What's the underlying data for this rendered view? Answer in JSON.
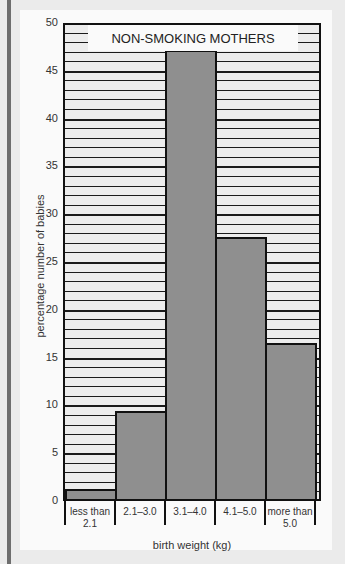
{
  "chart_data": {
    "type": "bar",
    "title": "NON-SMOKING MOTHERS",
    "categories": [
      "less than 2.1",
      "2.1–3.0",
      "3.1–4.0",
      "4.1–5.0",
      "more than 5.0"
    ],
    "category_lines": [
      [
        "less than",
        "2.1"
      ],
      [
        "2.1–3.0",
        ""
      ],
      [
        "3.1–4.0",
        ""
      ],
      [
        "4.1–5.0",
        ""
      ],
      [
        "more than",
        "5.0"
      ]
    ],
    "values": [
      1.0,
      9.2,
      47.0,
      27.4,
      16.3
    ],
    "xlabel": "birth weight (kg)",
    "ylabel": "percentage number of babies",
    "ylim": [
      0,
      50
    ],
    "yticks": [
      0,
      5,
      10,
      15,
      20,
      25,
      30,
      35,
      40,
      45,
      50
    ],
    "grid": true,
    "grid_minor_step": 1,
    "grid_major_step": 5,
    "bar_color": "#8f8f8f",
    "grid_bg_color": "#ececec"
  }
}
